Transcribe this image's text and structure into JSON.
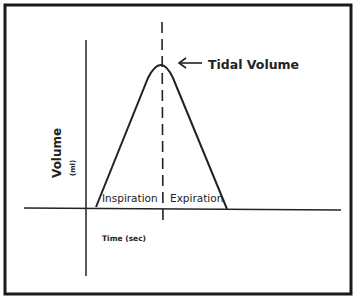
{
  "diagram": {
    "annotation": "Tidal Volume",
    "y_axis_label": "Volume",
    "y_axis_unit": "(ml)",
    "x_axis_label": "Time (sec)",
    "phases": [
      "Inspiration",
      "Expiration"
    ],
    "colors": {
      "line": "#222222",
      "frame": "#1a1a1a",
      "background": "#ffffff"
    }
  }
}
